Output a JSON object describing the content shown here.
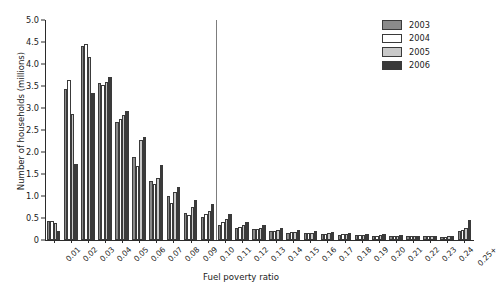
{
  "chart_data": {
    "type": "bar",
    "title": "",
    "xlabel": "Fuel poverty ratio",
    "ylabel": "Number of households (millions)",
    "ylim": [
      0,
      5.0
    ],
    "yticks": [
      "0",
      "0.5",
      "1.0",
      "1.5",
      "2.0",
      "2.5",
      "3.0",
      "3.5",
      "4.0",
      "4.5",
      "5.0"
    ],
    "ytick_values": [
      0,
      0.5,
      1.0,
      1.5,
      2.0,
      2.5,
      3.0,
      3.5,
      4.0,
      4.5,
      5.0
    ],
    "grid": false,
    "legend_position": "top-right",
    "categories": [
      "0.01",
      "0.02",
      "0.03",
      "0.04",
      "0.05",
      "0.06",
      "0.07",
      "0.08",
      "0.09",
      "0.10",
      "0.11",
      "0.12",
      "0.13",
      "0.14",
      "0.15",
      "0.16",
      "0.17",
      "0.18",
      "0.19",
      "0.20",
      "0.21",
      "0.22",
      "0.23",
      "0.24",
      "0.25+"
    ],
    "series": [
      {
        "name": "2003",
        "color": "#8a8a8a",
        "values": [
          0.44,
          3.43,
          4.42,
          3.56,
          2.68,
          1.88,
          1.35,
          1.01,
          0.61,
          0.52,
          0.34,
          0.28,
          0.24,
          0.2,
          0.17,
          0.15,
          0.14,
          0.12,
          0.11,
          0.1,
          0.09,
          0.08,
          0.08,
          0.07,
          0.2
        ]
      },
      {
        "name": "2004",
        "color": "#ffffff",
        "values": [
          0.44,
          3.63,
          4.46,
          3.52,
          2.74,
          1.68,
          1.27,
          0.84,
          0.56,
          0.6,
          0.4,
          0.29,
          0.25,
          0.21,
          0.18,
          0.16,
          0.14,
          0.13,
          0.11,
          0.1,
          0.09,
          0.09,
          0.08,
          0.07,
          0.22
        ]
      },
      {
        "name": "2005",
        "color": "#c9c9c9",
        "values": [
          0.39,
          2.87,
          4.16,
          3.58,
          2.84,
          2.27,
          1.4,
          1.1,
          0.74,
          0.66,
          0.47,
          0.33,
          0.27,
          0.23,
          0.19,
          0.17,
          0.15,
          0.13,
          0.12,
          0.11,
          0.1,
          0.09,
          0.08,
          0.08,
          0.28
        ]
      },
      {
        "name": "2006",
        "color": "#3a3a3a",
        "values": [
          0.21,
          1.72,
          3.35,
          3.7,
          2.93,
          2.34,
          1.7,
          1.21,
          0.91,
          0.81,
          0.58,
          0.41,
          0.33,
          0.27,
          0.23,
          0.2,
          0.18,
          0.16,
          0.14,
          0.13,
          0.11,
          0.1,
          0.1,
          0.09,
          0.46
        ]
      }
    ],
    "annotations": [
      {
        "type": "vline",
        "x_category": "0.10",
        "x_offset": "between 0.10 and 0.11",
        "label": "",
        "color": "#7d7d7d"
      }
    ]
  },
  "legend": {
    "items": [
      {
        "label": "2003",
        "color": "#8a8a8a"
      },
      {
        "label": "2004",
        "color": "#ffffff"
      },
      {
        "label": "2005",
        "color": "#c9c9c9"
      },
      {
        "label": "2006",
        "color": "#3a3a3a"
      }
    ]
  }
}
